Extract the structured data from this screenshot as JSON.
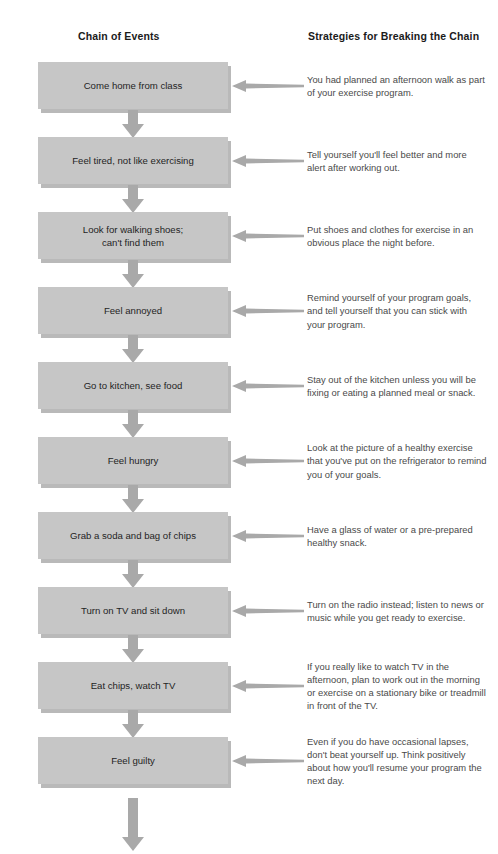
{
  "headers": {
    "chain": "Chain of Events",
    "strategies": "Strategies for Breaking the Chain"
  },
  "colors": {
    "box_fill": "#c6c6c6",
    "box_shadow": "#b9b9b9",
    "arrow": "#a9a9a9",
    "header_text": "#1b1b1b",
    "box_text": "#1f1f1f",
    "strategy_text": "#4a4a4a",
    "background": "#ffffff"
  },
  "rows": [
    {
      "event": "Come home from class",
      "strategy": "You had planned an afternoon walk as part of your exercise program."
    },
    {
      "event": "Feel tired, not like exercising",
      "strategy": "Tell yourself you'll feel better and more alert after working out."
    },
    {
      "event": "Look for walking shoes;\ncan't find them",
      "strategy": "Put shoes and clothes for exercise in an obvious place the night before."
    },
    {
      "event": "Feel annoyed",
      "strategy": "Remind yourself of your program goals, and tell yourself that you can stick with your program."
    },
    {
      "event": "Go to kitchen, see food",
      "strategy": "Stay out of the kitchen unless you will be fixing or eating a planned meal or snack."
    },
    {
      "event": "Feel hungry",
      "strategy": "Look at the picture of a healthy exercise that you've put on the refrigerator to remind you of your goals."
    },
    {
      "event": "Grab a soda and bag of chips",
      "strategy": "Have a glass of water or a pre-prepared healthy snack."
    },
    {
      "event": "Turn on TV and sit down",
      "strategy": "Turn on the radio instead; listen to news or music while you get ready to exercise."
    },
    {
      "event": "Eat chips, watch TV",
      "strategy": "If you really like to watch TV in the afternoon, plan to work out in the morning or exercise on a stationary bike or treadmill in front of the TV."
    },
    {
      "event": "Feel guilty",
      "strategy": "Even if you do have occasional lapses, don't beat yourself up. Think positively about how you'll resume your program the next day."
    }
  ]
}
